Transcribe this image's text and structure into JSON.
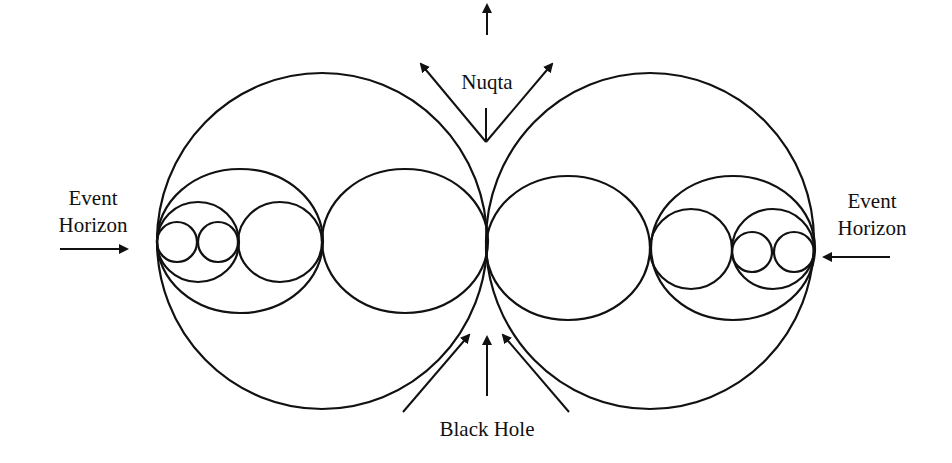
{
  "diagram": {
    "labels": {
      "nuqta": "Nuqta",
      "event_horizon_left_line1": "Event",
      "event_horizon_left_line2": "Horizon",
      "event_horizon_right_line1": "Event",
      "event_horizon_right_line2": "Horizon",
      "black_hole": "Black Hole"
    },
    "colors": {
      "stroke": "#111111",
      "background": "#ffffff"
    }
  }
}
